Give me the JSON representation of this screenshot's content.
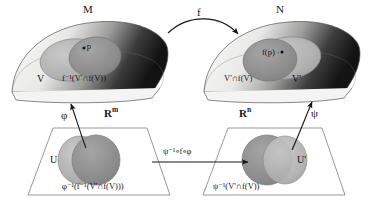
{
  "figure": {
    "type": "manifold-chart-commutative-diagram"
  },
  "manifolds": {
    "left": {
      "name": "M",
      "point_label": "·p",
      "region_outer_label": "V",
      "region_inner_label": "f⁻¹(V'∩f(V))"
    },
    "right": {
      "name": "N",
      "point_label": "f(p) ·",
      "region_outer_label": "V'",
      "region_inner_label": "V'∩f(V)"
    }
  },
  "euclidean": {
    "left": {
      "name": "R",
      "exponent": "m",
      "region_outer_label": "U",
      "region_inner_label": "φ⁻¹(f⁻¹(V'∩f(V)))"
    },
    "right": {
      "name": "R",
      "exponent": "n",
      "region_outer_label": "U'",
      "region_inner_label": "ψ⁻¹(V'∩f(V))"
    }
  },
  "maps": {
    "top_arrow": "f",
    "left_chart_arrow": "φ",
    "right_chart_arrow": "ψ",
    "bottom_arrow": "ψ⁻¹∘f∘φ"
  },
  "colors": {
    "ink": "#15161a",
    "surface_light": "#f2f2f0",
    "surface_dark": "#1d1d1d",
    "region_outer": "#b3b3b3",
    "region_inner": "#8e8e8e",
    "plane_line": "#7d7d84",
    "plane_fill": "#ffffff"
  }
}
